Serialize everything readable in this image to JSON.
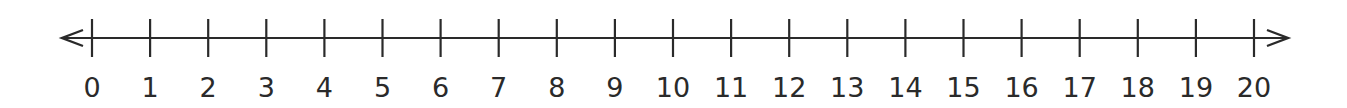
{
  "number_line": {
    "min": 0,
    "max": 20,
    "step": 1,
    "labels": [
      "0",
      "1",
      "2",
      "3",
      "4",
      "5",
      "6",
      "7",
      "8",
      "9",
      "10",
      "11",
      "12",
      "13",
      "14",
      "15",
      "16",
      "17",
      "18",
      "19",
      "20"
    ],
    "arrows": {
      "left": true,
      "right": true
    },
    "line_color": "#2a2a2a",
    "label_color": "#2a2a2a"
  },
  "chart_data": {
    "type": "number_line",
    "title": "",
    "x": [
      0,
      1,
      2,
      3,
      4,
      5,
      6,
      7,
      8,
      9,
      10,
      11,
      12,
      13,
      14,
      15,
      16,
      17,
      18,
      19,
      20
    ],
    "tick_labels": [
      "0",
      "1",
      "2",
      "3",
      "4",
      "5",
      "6",
      "7",
      "8",
      "9",
      "10",
      "11",
      "12",
      "13",
      "14",
      "15",
      "16",
      "17",
      "18",
      "19",
      "20"
    ],
    "xlim": [
      0,
      20
    ],
    "arrows_both_ends": true,
    "points": []
  }
}
